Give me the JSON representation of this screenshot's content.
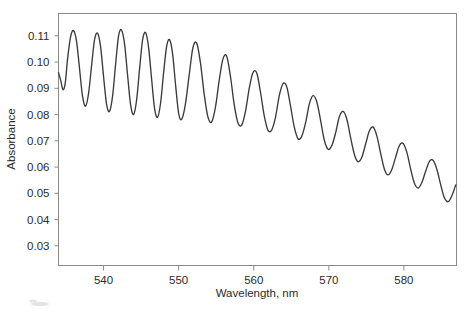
{
  "chart_data": {
    "type": "line",
    "title": "",
    "xlabel": "Wavelength, nm",
    "ylabel": "Absorbance",
    "xlim": [
      534,
      587
    ],
    "ylim": [
      0.0225,
      0.1185
    ],
    "xticks": [
      540,
      550,
      560,
      570,
      580
    ],
    "xticklabels": [
      "540",
      "550",
      "560",
      "570",
      "580"
    ],
    "yticks": [
      0.03,
      0.04,
      0.05,
      0.06,
      0.07,
      0.08,
      0.09,
      0.1,
      0.11
    ],
    "yticklabels": [
      "0.03",
      "0.04",
      "0.05",
      "0.06",
      "0.07",
      "0.08",
      "0.09",
      "0.10",
      "0.11"
    ],
    "grid": false,
    "legend": null,
    "line_color": "#3a3a3a",
    "frame_color": "#8a8a8a",
    "series": [
      {
        "name": "absorbance",
        "x": [
          534.0,
          534.3,
          534.6,
          534.9,
          535.2,
          535.6,
          536.0,
          536.4,
          536.8,
          537.2,
          537.6,
          538.0,
          538.4,
          538.8,
          539.2,
          539.6,
          540.0,
          540.4,
          540.8,
          541.2,
          541.6,
          542.0,
          542.4,
          542.8,
          543.2,
          543.6,
          544.0,
          544.4,
          544.8,
          545.2,
          545.6,
          546.0,
          546.4,
          546.8,
          547.2,
          547.6,
          548.0,
          548.4,
          548.8,
          549.2,
          549.6,
          550.0,
          550.4,
          550.9,
          551.4,
          551.9,
          552.4,
          552.9,
          553.4,
          553.9,
          554.4,
          554.9,
          555.4,
          555.9,
          556.4,
          556.9,
          557.4,
          557.9,
          558.4,
          558.9,
          559.4,
          559.9,
          560.4,
          560.9,
          561.4,
          561.9,
          562.4,
          562.9,
          563.4,
          563.9,
          564.4,
          564.9,
          565.4,
          565.9,
          566.4,
          566.9,
          567.4,
          567.9,
          568.4,
          568.9,
          569.4,
          569.9,
          570.4,
          570.9,
          571.4,
          571.9,
          572.4,
          572.9,
          573.4,
          573.9,
          574.4,
          574.9,
          575.4,
          575.9,
          576.4,
          576.9,
          577.4,
          577.9,
          578.4,
          578.9,
          579.4,
          579.9,
          580.4,
          580.9,
          581.4,
          581.9,
          582.4,
          582.9,
          583.4,
          583.9,
          584.4,
          584.9,
          585.4,
          585.9,
          586.4,
          586.9
        ],
        "y": [
          0.096,
          0.093,
          0.0895,
          0.092,
          0.101,
          0.1095,
          0.112,
          0.108,
          0.0975,
          0.087,
          0.0832,
          0.088,
          0.0985,
          0.1085,
          0.111,
          0.106,
          0.0945,
          0.084,
          0.0812,
          0.087,
          0.099,
          0.11,
          0.1122,
          0.1068,
          0.095,
          0.0838,
          0.08,
          0.0855,
          0.0975,
          0.1085,
          0.1112,
          0.1055,
          0.0935,
          0.0822,
          0.079,
          0.0845,
          0.096,
          0.106,
          0.1085,
          0.103,
          0.091,
          0.0805,
          0.0782,
          0.084,
          0.095,
          0.1055,
          0.1072,
          0.0998,
          0.0878,
          0.079,
          0.0772,
          0.0828,
          0.093,
          0.1012,
          0.1022,
          0.0945,
          0.0838,
          0.0768,
          0.076,
          0.0812,
          0.09,
          0.096,
          0.0958,
          0.0885,
          0.0795,
          0.074,
          0.0742,
          0.079,
          0.0872,
          0.0918,
          0.0905,
          0.0832,
          0.0752,
          0.0708,
          0.0718,
          0.0768,
          0.084,
          0.0872,
          0.0848,
          0.0778,
          0.0702,
          0.0668,
          0.0682,
          0.073,
          0.0792,
          0.0812,
          0.0782,
          0.0712,
          0.0648,
          0.062,
          0.0638,
          0.0688,
          0.0738,
          0.0752,
          0.0718,
          0.0652,
          0.0592,
          0.057,
          0.0592,
          0.0638,
          0.0682,
          0.069,
          0.0655,
          0.0592,
          0.0538,
          0.052,
          0.0542,
          0.0585,
          0.0622,
          0.0625,
          0.059,
          0.0532,
          0.0482,
          0.0468,
          0.0492,
          0.0532
        ]
      }
    ]
  },
  "artifacts": {
    "corner_smudge": "faint-gray-mark"
  }
}
